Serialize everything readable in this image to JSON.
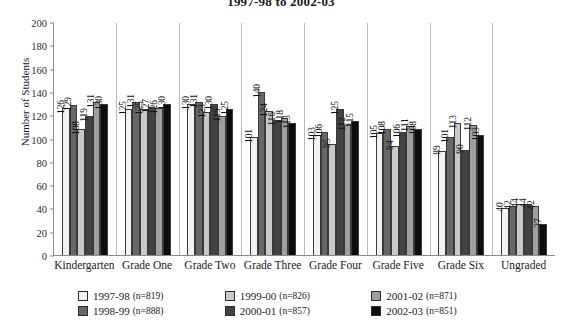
{
  "chart_data": {
    "type": "bar",
    "title": "1997-98 to 2002-03",
    "xlabel": "",
    "ylabel": "Number of Students",
    "ylim": [
      0,
      200
    ],
    "ytick_step": 20,
    "yticks": [
      "200",
      "180",
      "160",
      "140",
      "120",
      "100",
      "80",
      "60",
      "40",
      "20",
      "0"
    ],
    "grid": false,
    "legend_position": "bottom",
    "categories": [
      "Kindergarten",
      "Grade One",
      "Grade Two",
      "Grade Three",
      "Grade Four",
      "Grade Five",
      "Grade Six",
      "Ungraded"
    ],
    "series": [
      {
        "name": "1997-98",
        "n_label": "(n=819)",
        "color": "#f2f2f2",
        "values": [
          126,
          125,
          130,
          101,
          103,
          105,
          89,
          40
        ]
      },
      {
        "name": "1998-99",
        "n_label": "(n=888)",
        "color": "#676767",
        "values": [
          129,
          131,
          131,
          140,
          106,
          108,
          101,
          42
        ]
      },
      {
        "name": "1999-00",
        "n_label": "(n=826)",
        "color": "#c9c9c9",
        "values": [
          108,
          125,
          123,
          124,
          95,
          94,
          113,
          44
        ]
      },
      {
        "name": "2000-01",
        "n_label": "(n=857)",
        "color": "#434343",
        "values": [
          119,
          127,
          130,
          116,
          125,
          106,
          90,
          44
        ]
      },
      {
        "name": "2001-02",
        "n_label": "(n=871)",
        "color": "#a0a0a0",
        "values": [
          131,
          126,
          119,
          118,
          112,
          111,
          112,
          42
        ]
      },
      {
        "name": "2002-03",
        "n_label": "(n=851)",
        "color": "#0d0d0d",
        "values": [
          130,
          130,
          125,
          113,
          115,
          108,
          103,
          27
        ]
      }
    ]
  }
}
